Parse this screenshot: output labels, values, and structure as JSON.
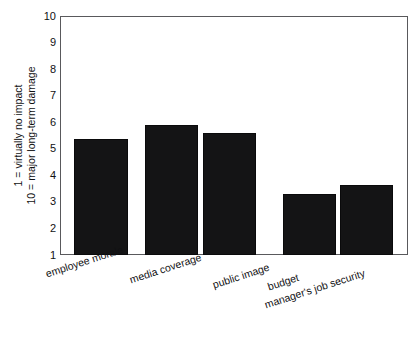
{
  "chart_data": {
    "type": "bar",
    "title": "",
    "subtitle": "",
    "xlabel": "",
    "ylabel": "1 = virtually no impact  /  10 = major long-term damage",
    "ylabel_lines": [
      "1 = virtually no impact",
      "10 = major long-term damage"
    ],
    "categories": [
      "employee morale",
      "media coverage",
      "public image",
      "budget",
      "manager's job security"
    ],
    "values": [
      5.35,
      5.9,
      5.6,
      3.3,
      3.65
    ],
    "ylim": [
      1,
      10
    ],
    "yticks": [
      1,
      2,
      3,
      4,
      5,
      6,
      7,
      8,
      9,
      10
    ],
    "ytick_labels": [
      "1",
      "2",
      "3",
      "4",
      "5",
      "6",
      "7",
      "8",
      "9",
      "10"
    ],
    "grid": false,
    "legend": null,
    "legend_position": "none",
    "bar_color": "#141415",
    "axis_color": "#59595c",
    "background_color": "#ffffff",
    "annotations": []
  },
  "axis": {
    "y_tick_labels": [
      "10",
      "9",
      "8",
      "7",
      "6",
      "5",
      "4",
      "3",
      "2",
      "1"
    ],
    "y_title_top": "10 = major long-term damage",
    "y_title_bottom": "1 = virtually no impact"
  },
  "series": {
    "bars": [
      {
        "label": "employee morale",
        "value": 5.35
      },
      {
        "label": "media coverage",
        "value": 5.9
      },
      {
        "label": "public image",
        "value": 5.6
      },
      {
        "label": "budget",
        "value": 3.3
      },
      {
        "label": "manager's job security",
        "value": 3.65
      }
    ]
  }
}
